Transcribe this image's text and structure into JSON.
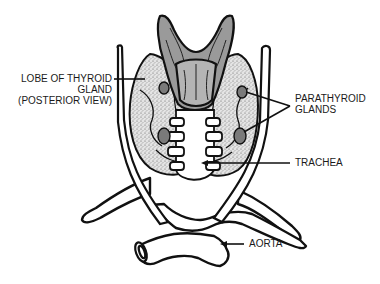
{
  "diagram": {
    "labels": {
      "thyroid_lobe": {
        "line1": "LOBE OF THYROID",
        "line2": "GLAND",
        "line3": "(POSTERIOR VIEW)"
      },
      "parathyroid": {
        "line1": "PARATHYROID",
        "line2": "GLANDS"
      },
      "trachea": {
        "text": "TRACHEA"
      },
      "aorta": {
        "text": "AORTA"
      }
    },
    "colors": {
      "outline": "#111111",
      "pharynx_fill": "#9a9a9a",
      "gland_stipple": "#d8d8d8",
      "parathyroid_fill": "#7a7a7a",
      "background": "#ffffff"
    }
  }
}
